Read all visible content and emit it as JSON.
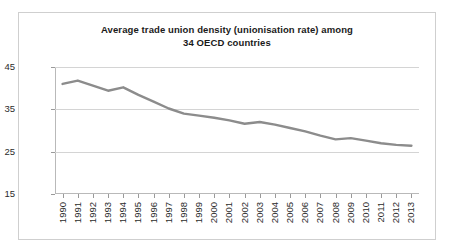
{
  "chart_data": {
    "type": "line",
    "title": "Average trade union density (unionisation rate) among 34 OECD countries",
    "title_line1": "Average trade union density (unionisation rate) among",
    "title_line2": "34 OECD countries",
    "xlabel": "",
    "ylabel": "",
    "ylim": [
      15,
      45
    ],
    "yticks": [
      15,
      25,
      35,
      45
    ],
    "grid": true,
    "legend": false,
    "series_color": "#8c8c8c",
    "categories": [
      "1990",
      "1991",
      "1992",
      "1993",
      "1994",
      "1995",
      "1996",
      "1997",
      "1998",
      "1999",
      "2000",
      "2001",
      "2002",
      "2003",
      "2004",
      "2005",
      "2006",
      "2007",
      "2008",
      "2009",
      "2010",
      "2011",
      "2012",
      "2013"
    ],
    "values": [
      41.0,
      41.8,
      40.6,
      39.4,
      40.2,
      38.4,
      36.8,
      35.2,
      34.0,
      33.5,
      33.0,
      32.4,
      31.6,
      32.0,
      31.4,
      30.6,
      29.8,
      28.8,
      27.9,
      28.2,
      27.6,
      27.0,
      26.6,
      26.4
    ]
  }
}
